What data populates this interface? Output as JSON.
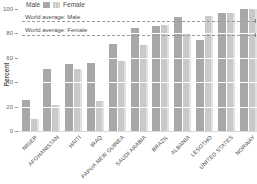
{
  "legend": {
    "male_label": "Male",
    "female_label": "Female"
  },
  "y_axis": {
    "label": "Percent",
    "ticks": [
      0,
      20,
      40,
      60,
      80,
      100
    ]
  },
  "reference_lines": [
    {
      "label": "World average: Male",
      "value": 90
    },
    {
      "label": "World average: Female",
      "value": 79
    }
  ],
  "chart_data": {
    "type": "bar",
    "title": "",
    "xlabel": "",
    "ylabel": "Percent",
    "ylim": [
      0,
      100
    ],
    "grid": "white horizontal gridlines over bars at 20/40/60/80",
    "legend_position": "top-left",
    "categories": [
      "NIGER",
      "AFGHANISTAN",
      "HAITI",
      "IRAQ",
      "PAPUA NEW GUINEA",
      "SAUDI ARABIA",
      "BRAZIL",
      "ALBANIA",
      "LESOTHO",
      "UNITED STATES",
      "NORWAY"
    ],
    "series": [
      {
        "name": "Male",
        "values": [
          25.8,
          51.0,
          54.8,
          55.9,
          71.1,
          84.7,
          86.1,
          93.3,
          74.5,
          97.0,
          100.0
        ]
      },
      {
        "name": "Female",
        "values": [
          9.7,
          21.0,
          51.2,
          24.4,
          57.7,
          70.8,
          86.6,
          79.5,
          94.5,
          97.0,
          100.0
        ]
      }
    ],
    "reference_lines": [
      {
        "label": "World average: Male",
        "value": 90
      },
      {
        "label": "World average: Female",
        "value": 79
      }
    ]
  },
  "colors": {
    "male_bar": "#a8a8a8",
    "female_bar": "#c9c9c9",
    "dashed_line": "#9a9a9a",
    "text": "#4a4a4a",
    "tick_text": "#666666"
  }
}
